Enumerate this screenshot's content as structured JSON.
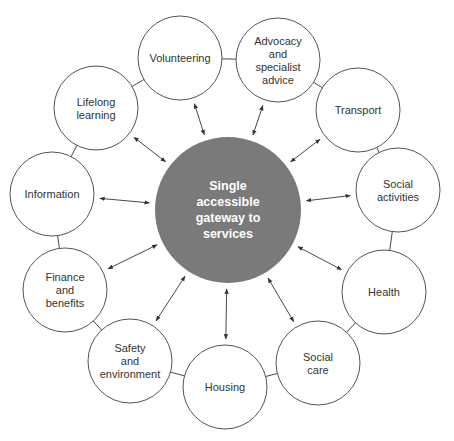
{
  "diagram": {
    "type": "hub-and-spoke",
    "center": {
      "label_lines": [
        "Single",
        "accessible",
        "gateway to",
        "services"
      ],
      "color": "#7a7a7a",
      "x": 228,
      "y": 210,
      "r": 73
    },
    "nodes": [
      {
        "id": "volunteering",
        "label_lines": [
          "Volunteering"
        ],
        "x": 180,
        "y": 58
      },
      {
        "id": "advocacy",
        "label_lines": [
          "Advocacy",
          "and",
          "specialist",
          "advice"
        ],
        "x": 278,
        "y": 60
      },
      {
        "id": "transport",
        "label_lines": [
          "Transport"
        ],
        "x": 358,
        "y": 110
      },
      {
        "id": "social-activities",
        "label_lines": [
          "Social",
          "activities"
        ],
        "x": 398,
        "y": 190
      },
      {
        "id": "health",
        "label_lines": [
          "Health"
        ],
        "x": 384,
        "y": 292
      },
      {
        "id": "social-care",
        "label_lines": [
          "Social",
          "care"
        ],
        "x": 318,
        "y": 363
      },
      {
        "id": "housing",
        "label_lines": [
          "Housing"
        ],
        "x": 225,
        "y": 387
      },
      {
        "id": "safety",
        "label_lines": [
          "Safety",
          "and",
          "environment"
        ],
        "x": 130,
        "y": 361
      },
      {
        "id": "finance",
        "label_lines": [
          "Finance",
          "and",
          "benefits"
        ],
        "x": 65,
        "y": 290
      },
      {
        "id": "information",
        "label_lines": [
          "Information"
        ],
        "x": 52,
        "y": 194
      },
      {
        "id": "lifelong-learning",
        "label_lines": [
          "Lifelong",
          "learning"
        ],
        "x": 96,
        "y": 108
      }
    ],
    "node_radius": 42,
    "arrows": "bidirectional: each node to center, and each node to its neighbours around the ring (except Volunteering–Lifelong learning closes ring)"
  }
}
